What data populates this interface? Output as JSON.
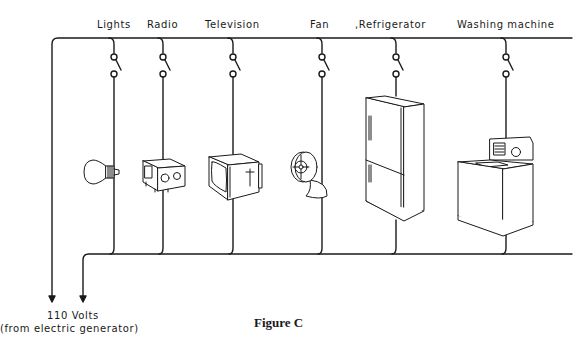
{
  "figure": {
    "caption": "Figure C",
    "source": {
      "line1": "110 Volts",
      "line2": "(from electric generator)"
    },
    "appliances": [
      {
        "label": "Lights",
        "icon": "light-bulb-icon"
      },
      {
        "label": "Radio",
        "icon": "radio-icon"
      },
      {
        "label": "Television",
        "icon": "television-icon"
      },
      {
        "label": "Fan",
        "icon": "fan-icon"
      },
      {
        "label": ",Refrigerator",
        "icon": "refrigerator-icon"
      },
      {
        "label": "Washing machine",
        "icon": "washing-machine-icon"
      }
    ],
    "circuit": "parallel",
    "colors": {
      "line": "#1a1a1a",
      "background": "#ffffff"
    }
  }
}
